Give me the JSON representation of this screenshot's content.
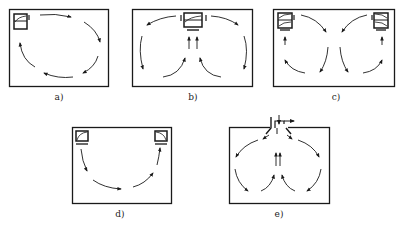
{
  "diagram": {
    "colors": {
      "stroke": "#1a1a1a",
      "background": "#ffffff"
    },
    "panels": [
      {
        "id": "a",
        "label": "a)",
        "description": "Single unit top-left, single circular loop around the room",
        "units": [
          "top-left"
        ]
      },
      {
        "id": "b",
        "label": "b)",
        "description": "Single unit top-center, two loops; upward flow in center, down along side walls",
        "units": [
          "top-center"
        ]
      },
      {
        "id": "c",
        "label": "c)",
        "description": "Two units at top corners, flows meet at center and descend, return up side walls",
        "units": [
          "top-left",
          "top-right"
        ]
      },
      {
        "id": "d",
        "label": "d)",
        "description": "Two units at top corners, single U-shaped flow along the floor",
        "units": [
          "top-left",
          "top-right"
        ]
      },
      {
        "id": "e",
        "label": "e)",
        "description": "Ducted ceiling supply top-center, two loops with upward central return",
        "units": [
          "ceiling-duct"
        ]
      }
    ]
  }
}
